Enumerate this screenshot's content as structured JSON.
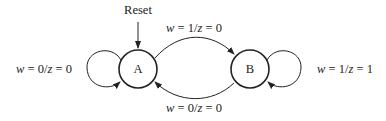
{
  "diagram": {
    "type": "state-machine",
    "reset_label": "Reset",
    "states": [
      {
        "id": "A",
        "label": "A"
      },
      {
        "id": "B",
        "label": "B"
      }
    ],
    "transitions": [
      {
        "from": "A",
        "to": "A",
        "w": "0",
        "z": "0",
        "label": "w = 0/z = 0"
      },
      {
        "from": "A",
        "to": "B",
        "w": "1",
        "z": "0",
        "label": "w = 1/z = 0"
      },
      {
        "from": "B",
        "to": "B",
        "w": "1",
        "z": "1",
        "label": "w = 1/z = 1"
      },
      {
        "from": "B",
        "to": "A",
        "w": "0",
        "z": "0",
        "label": "w = 0/z = 0"
      }
    ]
  }
}
